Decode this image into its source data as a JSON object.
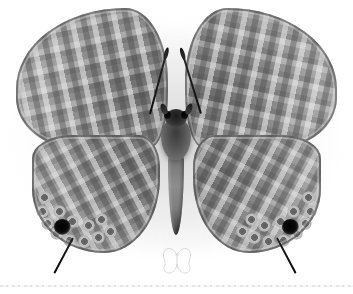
{
  "image": {
    "subject": "butterfly specimen, dorsal spread mount",
    "view": "dorsal",
    "capture_style": "grayscale specimen plate photograph on white background",
    "alt_text": "Grayscale photograph of a spread butterfly specimen with patterned wings, two filamentous tails and a black eyespot near each hindwing margin."
  },
  "palette": {
    "background": "#ffffff",
    "paper_tint": "#f3f3f3",
    "wing_midtone": "#8a8a8a",
    "wing_light_band": "#b8b8b8",
    "wing_dark_band": "#4a4a4a",
    "body_dark": "#2e2e2e",
    "eyespot_black": "#000000",
    "abdomen_grey": "#8d8d8d",
    "scan_edge_line": "#e2e2e2",
    "watermark_outline": "#b9b9b9"
  },
  "specimen": {
    "name": "butterfly-specimen",
    "parts": [
      {
        "key": "forewing_left",
        "label": "Left forewing",
        "tone": "#8a8a8a",
        "pattern": "wavy transverse light and dark striae"
      },
      {
        "key": "forewing_right",
        "label": "Right forewing",
        "tone": "#8a8a8a",
        "pattern": "wavy transverse light and dark striae"
      },
      {
        "key": "hindwing_left",
        "label": "Left hindwing",
        "tone": "#8b8b8b",
        "pattern": "maze bands with marginal ring ocelli"
      },
      {
        "key": "hindwing_right",
        "label": "Right hindwing",
        "tone": "#8b8b8b",
        "pattern": "maze bands with marginal ring ocelli"
      },
      {
        "key": "thorax",
        "label": "Thorax",
        "tone": "#545454",
        "pattern": "dark hairy scaling"
      },
      {
        "key": "head",
        "label": "Head",
        "tone": "#2e2e2e",
        "pattern": "dark with paired compound eyes"
      },
      {
        "key": "abdomen",
        "label": "Abdomen",
        "tone": "#8d8d8d",
        "pattern": "pale grey tapering, dark tip"
      },
      {
        "key": "antenna_left",
        "label": "Left antenna",
        "tone": "#141414",
        "pattern": "slender shaft with clubbed tip"
      },
      {
        "key": "antenna_right",
        "label": "Right antenna",
        "tone": "#141414",
        "pattern": "slender shaft with clubbed tip"
      },
      {
        "key": "tail_left",
        "label": "Left hindwing tail",
        "tone": "#0f0f0f",
        "pattern": "fine filamentous tail"
      },
      {
        "key": "tail_right",
        "label": "Right hindwing tail",
        "tone": "#0f0f0f",
        "pattern": "fine filamentous tail"
      }
    ],
    "eyespots": [
      {
        "key": "eyespot_left",
        "label": "Left hindwing eyespot",
        "color": "#000000"
      },
      {
        "key": "eyespot_right",
        "label": "Right hindwing eyespot",
        "color": "#000000"
      }
    ],
    "ocelli_left": [
      {
        "x": 6,
        "y": 56
      },
      {
        "x": 4,
        "y": 70
      },
      {
        "x": 9,
        "y": 82
      },
      {
        "x": 18,
        "y": 92
      },
      {
        "x": 31,
        "y": 99
      },
      {
        "x": 46,
        "y": 100
      },
      {
        "x": 60,
        "y": 96
      },
      {
        "x": 72,
        "y": 90
      },
      {
        "x": 21,
        "y": 70
      },
      {
        "x": 34,
        "y": 80
      },
      {
        "x": 50,
        "y": 84
      },
      {
        "x": 63,
        "y": 78
      }
    ],
    "ocelli_right": [
      {
        "x": 109,
        "y": 56
      },
      {
        "x": 111,
        "y": 70
      },
      {
        "x": 106,
        "y": 82
      },
      {
        "x": 97,
        "y": 92
      },
      {
        "x": 84,
        "y": 99
      },
      {
        "x": 69,
        "y": 100
      },
      {
        "x": 55,
        "y": 96
      },
      {
        "x": 43,
        "y": 90
      },
      {
        "x": 94,
        "y": 70
      },
      {
        "x": 81,
        "y": 80
      },
      {
        "x": 65,
        "y": 84
      },
      {
        "x": 52,
        "y": 78
      }
    ]
  },
  "watermark": {
    "name": "butterfly-outline-watermark",
    "label": "Butterfly outline watermark",
    "color": "#b9b9b9"
  },
  "scan_artifacts": {
    "edge_line_label": "Scan edge line"
  }
}
